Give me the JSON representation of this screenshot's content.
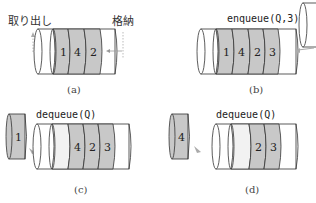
{
  "colors": {
    "filled": "#c8c8c8",
    "empty": "#ffffff",
    "light": "#f2f2f2",
    "stroke": "#333333",
    "arrow": "#999999"
  },
  "panel_a": {
    "label_out": "取り出し",
    "label_in": "格納",
    "items": [
      "1",
      "4",
      "2"
    ],
    "caption": "(a)"
  },
  "panel_b": {
    "op": "enqueue(Q,3)",
    "items": [
      "1",
      "4",
      "2",
      "3"
    ],
    "caption": "(b)"
  },
  "panel_c": {
    "op": "dequeue(Q)",
    "removed": "1",
    "items": [
      "4",
      "2",
      "3"
    ],
    "caption": "(c)"
  },
  "panel_d": {
    "op": "dequeue(Q)",
    "removed": "4",
    "items": [
      "2",
      "3"
    ],
    "caption": "(d)"
  }
}
